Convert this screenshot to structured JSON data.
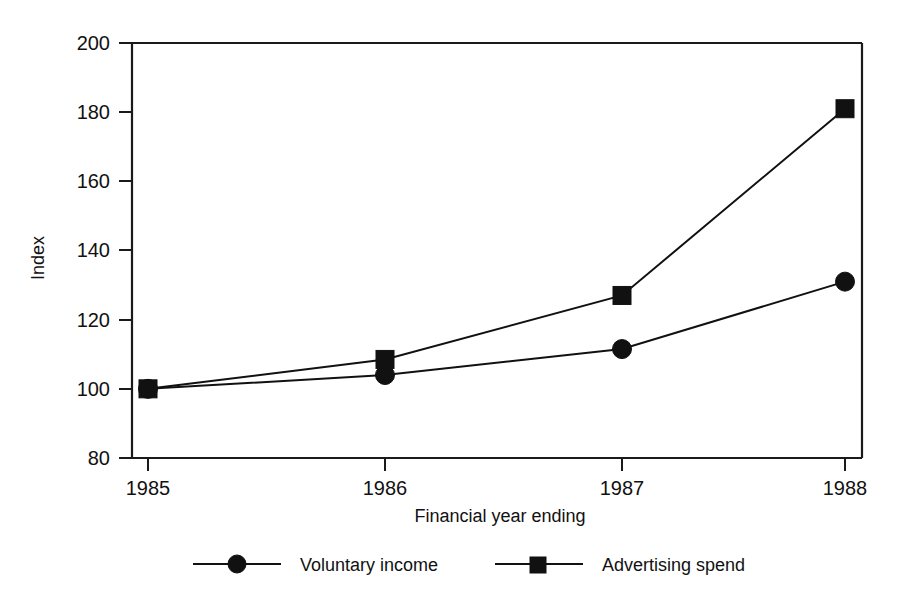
{
  "chart_data": {
    "type": "line",
    "title": "",
    "xlabel": "Financial year ending",
    "ylabel": "Index",
    "categories": [
      "1985",
      "1986",
      "1987",
      "1988"
    ],
    "x": [
      1985,
      1986,
      1987,
      1988
    ],
    "ylim": [
      80,
      200
    ],
    "yticks": [
      80,
      100,
      120,
      140,
      160,
      180,
      200
    ],
    "ytick_labels": [
      "80",
      "100",
      "120",
      "140",
      "160",
      "180",
      "200"
    ],
    "grid": false,
    "legend_position": "bottom",
    "series": [
      {
        "name": "Voluntary income",
        "marker": "circle",
        "values": [
          100,
          104,
          111.5,
          131
        ]
      },
      {
        "name": "Advertising spend",
        "marker": "square",
        "values": [
          100,
          108.5,
          127,
          181
        ]
      }
    ]
  },
  "axes": {
    "y_title": "Index",
    "x_title": "Financial year ending",
    "y_tick_labels": [
      "200",
      "180",
      "160",
      "140",
      "120",
      "100",
      "80"
    ],
    "x_tick_labels": [
      "1985",
      "1986",
      "1987",
      "1988"
    ]
  },
  "legend": {
    "entries": [
      {
        "label": "Voluntary income",
        "marker": "circle"
      },
      {
        "label": "Advertising spend",
        "marker": "square"
      }
    ]
  },
  "colors": {
    "ink": "#111111",
    "background": "#ffffff"
  }
}
